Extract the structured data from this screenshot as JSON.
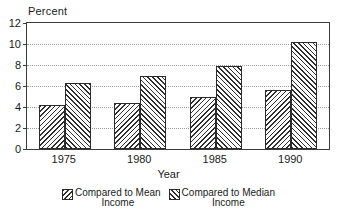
{
  "chart_data": {
    "type": "bar",
    "title": "",
    "subtitle": "",
    "xlabel": "Year",
    "ylabel": "Percent",
    "categories": [
      "1975",
      "1980",
      "1985",
      "1990"
    ],
    "series": [
      {
        "name": "Compared to Mean\nIncome",
        "legend_line1": "Compared to Mean",
        "legend_line2": "Income",
        "pattern": "backslash-hatch",
        "values": [
          4.2,
          4.4,
          5.0,
          5.6
        ]
      },
      {
        "name": "Compared to Median\nIncome",
        "legend_line1": "Compared to Median",
        "legend_line2": "Income",
        "pattern": "forwardslash-hatch",
        "values": [
          6.25,
          7.0,
          7.9,
          10.2
        ]
      }
    ],
    "ylim": [
      0,
      12
    ],
    "yticks": [
      0,
      2,
      4,
      6,
      8,
      10,
      12
    ],
    "ytick_labels": [
      "0",
      "2",
      "4",
      "6",
      "8",
      "10",
      "12"
    ],
    "grid": "horizontal-dotted",
    "legend_position": "bottom-center",
    "colors": {
      "hatch": "#2e2e2e",
      "bar_border": "#2b2b2b",
      "axis": "#3b3b3b",
      "gridline": "#9a9a9a",
      "background": "#ffffff",
      "text": "#1a1a1a"
    }
  }
}
